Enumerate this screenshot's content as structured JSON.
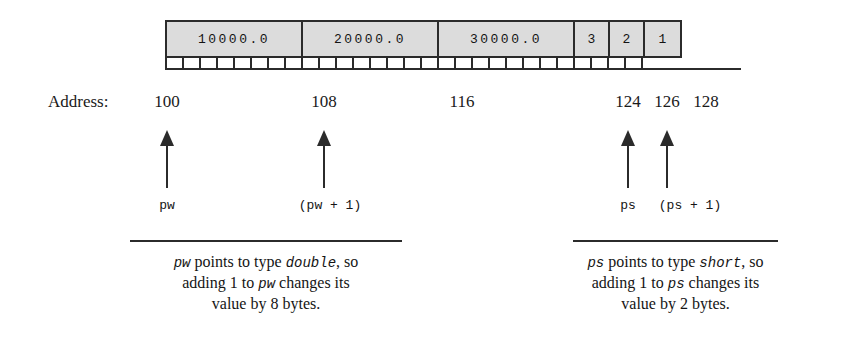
{
  "diagram": {
    "memory_bar": {
      "start_address": 100,
      "end_address": 128,
      "byte_width_px": 17,
      "cells": [
        {
          "value": "10000.0",
          "size_bytes": 8,
          "type": "double",
          "start": 100
        },
        {
          "value": "20000.0",
          "size_bytes": 8,
          "type": "double",
          "start": 108
        },
        {
          "value": "30000.0",
          "size_bytes": 8,
          "type": "double",
          "start": 116
        },
        {
          "value": "3",
          "size_bytes": 2,
          "type": "short",
          "start": 124
        },
        {
          "value": "2",
          "size_bytes": 2,
          "type": "short",
          "start": 126
        },
        {
          "value": "1",
          "size_bytes": 2,
          "type": "short",
          "start": 128
        }
      ],
      "fill_color": "#dcdcdc",
      "border_color": "#2b2b2b"
    },
    "address_row": {
      "label": "Address:",
      "addresses": [
        {
          "text": "100",
          "x": 167
        },
        {
          "text": "108",
          "x": 324
        },
        {
          "text": "116",
          "x": 462
        },
        {
          "text": "124",
          "x": 628
        },
        {
          "text": "126",
          "x": 667
        },
        {
          "text": "128",
          "x": 706
        }
      ]
    },
    "pointers": [
      {
        "label": "pw",
        "x": 167,
        "label_x": 167
      },
      {
        "label": "(pw + 1)",
        "x": 324,
        "label_x": 330
      },
      {
        "label": "ps",
        "x": 628,
        "label_x": 628
      },
      {
        "label": "(ps + 1)",
        "x": 667,
        "label_x": 690
      }
    ],
    "captions": [
      {
        "id": "left-caption",
        "rule": {
          "x": 130,
          "width": 272
        },
        "lines": [
          [
            {
              "t": "pw",
              "mono": true
            },
            {
              "t": " points to type ",
              "mono": false
            },
            {
              "t": "double",
              "mono": true
            },
            {
              "t": ", so",
              "mono": false
            }
          ],
          [
            {
              "t": "adding 1 to ",
              "mono": false
            },
            {
              "t": "pw",
              "mono": true
            },
            {
              "t": " changes its",
              "mono": false
            }
          ],
          [
            {
              "t": "value by 8 bytes.",
              "mono": false
            }
          ]
        ]
      },
      {
        "id": "right-caption",
        "rule": {
          "x": 573,
          "width": 205
        },
        "lines": [
          [
            {
              "t": "ps",
              "mono": true
            },
            {
              "t": " points to type ",
              "mono": false
            },
            {
              "t": "short",
              "mono": true
            },
            {
              "t": ", so",
              "mono": false
            }
          ],
          [
            {
              "t": "adding 1 to ",
              "mono": false
            },
            {
              "t": "ps",
              "mono": true
            },
            {
              "t": " changes its",
              "mono": false
            }
          ],
          [
            {
              "t": "value by 2 bytes.",
              "mono": false
            }
          ]
        ]
      }
    ]
  }
}
